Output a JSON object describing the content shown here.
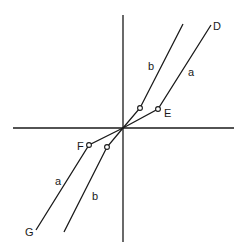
{
  "diagram": {
    "labels": {
      "D": "D",
      "E": "E",
      "F": "F",
      "G": "G",
      "a_upper": "a",
      "b_upper": "b",
      "a_lower": "a",
      "b_lower": "b"
    },
    "colors": {
      "line": "#1a1a1a",
      "background": "#ffffff"
    }
  }
}
